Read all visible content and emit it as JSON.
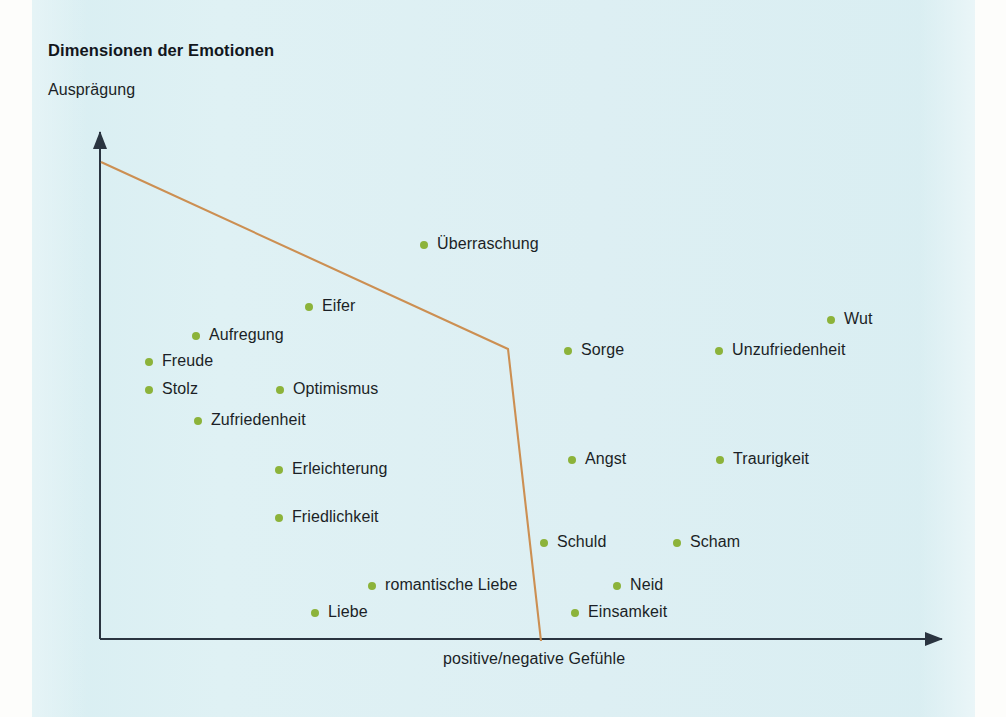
{
  "chart_data": {
    "type": "scatter",
    "title": "Dimensionen der Emotionen",
    "xlabel": "positive/negative Gefühle",
    "ylabel": "Ausprägung",
    "grid": false,
    "legend": null,
    "xlim": [
      0,
      100
    ],
    "ylim": [
      0,
      100
    ],
    "axes": {
      "origin": [
        100,
        639
      ],
      "x_arrow_tip": [
        950,
        639
      ],
      "y_arrow_tip": [
        100,
        125
      ],
      "color": "#2a3440"
    },
    "boundary_line": {
      "name": "emotion-boundary-line",
      "color": "#cc8f52",
      "points": [
        [
          101,
          162
        ],
        [
          508,
          349
        ],
        [
          541,
          641
        ]
      ]
    },
    "point_color": "#8cb33a",
    "points": [
      {
        "label": "Überraschung",
        "x": 420,
        "y": 245
      },
      {
        "label": "Eifer",
        "x": 305,
        "y": 307
      },
      {
        "label": "Wut",
        "x": 827,
        "y": 320
      },
      {
        "label": "Aufregung",
        "x": 192,
        "y": 336
      },
      {
        "label": "Sorge",
        "x": 564,
        "y": 351
      },
      {
        "label": "Unzufriedenheit",
        "x": 715,
        "y": 351
      },
      {
        "label": "Freude",
        "x": 145,
        "y": 362
      },
      {
        "label": "Stolz",
        "x": 145,
        "y": 390
      },
      {
        "label": "Optimismus",
        "x": 276,
        "y": 390
      },
      {
        "label": "Zufriedenheit",
        "x": 194,
        "y": 421
      },
      {
        "label": "Angst",
        "x": 568,
        "y": 460
      },
      {
        "label": "Traurigkeit",
        "x": 716,
        "y": 460
      },
      {
        "label": "Erleichterung",
        "x": 275,
        "y": 470
      },
      {
        "label": "Friedlichkeit",
        "x": 275,
        "y": 518
      },
      {
        "label": "Schuld",
        "x": 540,
        "y": 543
      },
      {
        "label": "Scham",
        "x": 673,
        "y": 543
      },
      {
        "label": "romantische Liebe",
        "x": 368,
        "y": 586
      },
      {
        "label": "Neid",
        "x": 613,
        "y": 586
      },
      {
        "label": "Liebe",
        "x": 311,
        "y": 613
      },
      {
        "label": "Einsamkeit",
        "x": 571,
        "y": 613
      }
    ]
  },
  "page": {
    "background_color": "#ddf0f3",
    "paper_color": "#fdfdfb"
  }
}
